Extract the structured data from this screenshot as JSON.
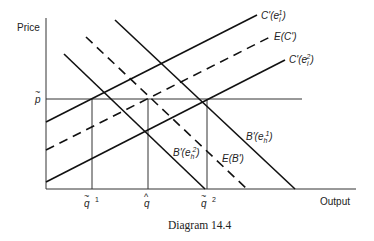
{
  "diagram": {
    "caption": "Diagram 14.4",
    "axes": {
      "y_label": "Price",
      "x_label": "Output"
    },
    "price_marker": {
      "symbol": "p",
      "accent": "~"
    },
    "quantity_markers": [
      {
        "id": "q_tilde_1",
        "symbol": "q",
        "accent": "~",
        "superscript": "1"
      },
      {
        "id": "q_hat",
        "symbol": "q",
        "accent": "^",
        "superscript": ""
      },
      {
        "id": "q_tilde_2",
        "symbol": "q",
        "accent": "~",
        "superscript": "2"
      }
    ],
    "supply_curves": [
      {
        "id": "C_e1",
        "base": "C'(e",
        "sub": "i",
        "sup": "1",
        "close": ")",
        "style": "solid"
      },
      {
        "id": "E_C",
        "base": "E(C')",
        "style": "dashed"
      },
      {
        "id": "C_e2",
        "base": "C'(e",
        "sub": "i",
        "sup": "2",
        "close": ")",
        "style": "solid"
      }
    ],
    "demand_curves": [
      {
        "id": "B_e1",
        "base": "B'(e",
        "sub": "h",
        "sup": "1",
        "close": ")",
        "style": "solid"
      },
      {
        "id": "E_B",
        "base": "E(B')",
        "style": "dashed"
      },
      {
        "id": "B_e2",
        "base": "B'(e",
        "sub": "h",
        "sup": "2",
        "close": ")",
        "style": "solid"
      }
    ],
    "line_color": "#111111"
  }
}
